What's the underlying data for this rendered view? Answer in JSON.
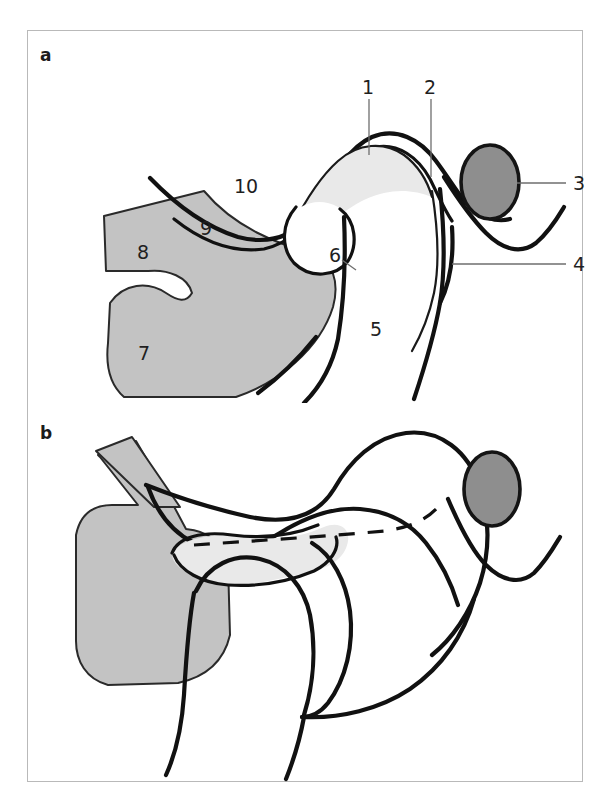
{
  "figure": {
    "type": "anatomical-line-diagram",
    "border_color": "#b9b9b9",
    "background_color": "#ffffff",
    "ink_color": "#111111",
    "panels": [
      {
        "id": "a",
        "letter": "a",
        "state": "closed-mouth position (labelled)",
        "has_labels": true
      },
      {
        "id": "b",
        "letter": "b",
        "state": "open-mouth position (unlabelled)",
        "has_labels": false
      }
    ]
  },
  "colors": {
    "mandible_gray": "#c3c3c3",
    "disc_light_gray": "#e9e9e9",
    "ear_lobule_gray": "#8e8e8e",
    "outline_black": "#111111",
    "leader_line_gray": "#6e6e6e",
    "frame_gray": "#b9b9b9"
  },
  "panel_a": {
    "letter": "a",
    "labels": [
      {
        "id": "l1",
        "text": "1",
        "x": 340,
        "y": 56,
        "leader": {
          "x1": 341,
          "y1": 68,
          "x2": 341,
          "y2": 124
        }
      },
      {
        "id": "l2",
        "text": "2",
        "x": 402,
        "y": 56,
        "leader": {
          "x1": 403,
          "y1": 68,
          "x2": 403,
          "y2": 146
        }
      },
      {
        "id": "l3",
        "text": "3",
        "x": 551,
        "y": 152,
        "leader": {
          "x1": 489,
          "y1": 152,
          "x2": 538,
          "y2": 152
        }
      },
      {
        "id": "l4",
        "text": "4",
        "x": 551,
        "y": 233,
        "leader": {
          "x1": 424,
          "y1": 233,
          "x2": 538,
          "y2": 233
        }
      },
      {
        "id": "l5",
        "text": "5",
        "x": 348,
        "y": 298,
        "leader": null
      },
      {
        "id": "l6",
        "text": "6",
        "x": 307,
        "y": 224,
        "leader": {
          "x1": 315,
          "y1": 228,
          "x2": 327,
          "y2": 238
        }
      },
      {
        "id": "l7",
        "text": "7",
        "x": 116,
        "y": 322,
        "leader": null
      },
      {
        "id": "l8",
        "text": "8",
        "x": 115,
        "y": 221,
        "leader": null
      },
      {
        "id": "l9",
        "text": "9",
        "x": 178,
        "y": 197,
        "leader": null
      },
      {
        "id": "l10",
        "text": "10",
        "x": 218,
        "y": 155,
        "leader": null
      }
    ],
    "label_count": 10
  },
  "panel_b": {
    "letter": "b",
    "labels": [],
    "label_count": 0,
    "features": [
      "dashed reference line across condylar path",
      "anteriorly translated condyle",
      "articular disc displaced forward"
    ]
  }
}
